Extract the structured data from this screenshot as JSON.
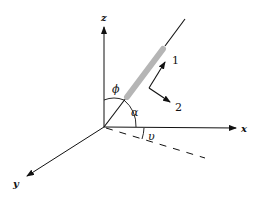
{
  "diagram": {
    "title": "",
    "axes": {
      "x": {
        "label": "x"
      },
      "y": {
        "label": "y"
      },
      "z": {
        "label": "z"
      }
    },
    "angles": {
      "phi": "ϕ",
      "alpha": "α",
      "upsilon": "υ"
    },
    "direction_arrows": {
      "arrow1": "1",
      "arrow2": "2"
    },
    "colors": {
      "lines": "#111111",
      "rod": "#b5b5b5",
      "background": "#ffffff"
    }
  }
}
